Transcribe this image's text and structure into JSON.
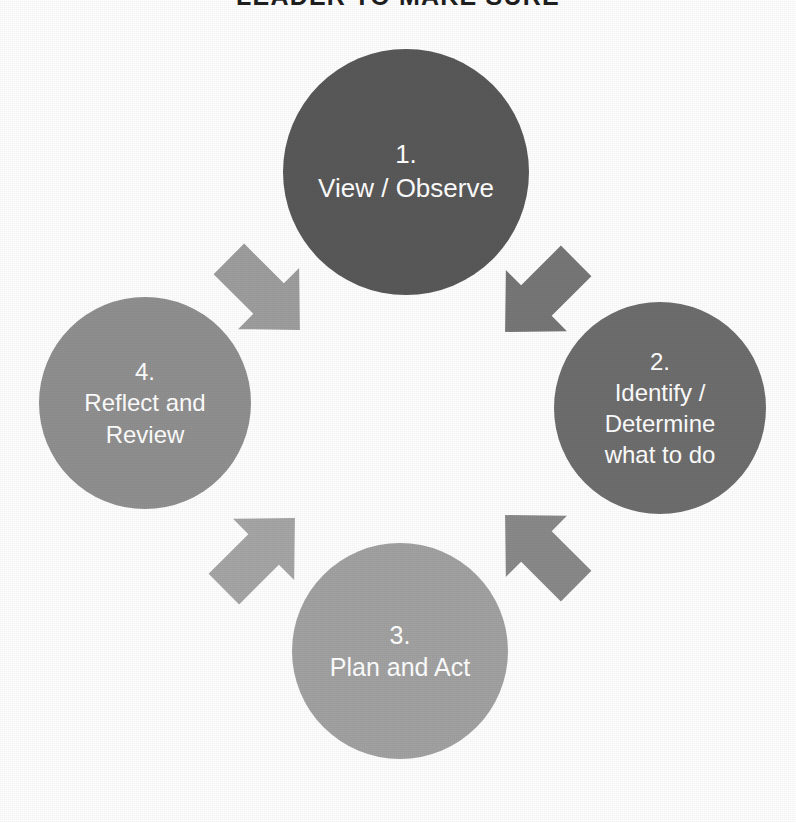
{
  "page": {
    "width": 796,
    "height": 822,
    "background": "#ffffff"
  },
  "title": {
    "text": "LEADER TO MAKE SURE",
    "color": "#1f1f1f",
    "clipped_at_top": true
  },
  "diagram": {
    "type": "cycle",
    "direction": "clockwise",
    "step_count": 4,
    "nodes": [
      {
        "id": "node-1",
        "number": "1.",
        "label": "1.\nView / Observe",
        "position": "top",
        "cx": 406,
        "cy": 172,
        "diameter": 246,
        "color": "#595959"
      },
      {
        "id": "node-2",
        "number": "2.",
        "label": "2.\nIdentify /\nDetermine\nwhat to do",
        "position": "right",
        "cx": 660,
        "cy": 408,
        "diameter": 212,
        "color": "#6e6e6e"
      },
      {
        "id": "node-3",
        "number": "3.",
        "label": "3.\nPlan and Act",
        "position": "bottom",
        "cx": 400,
        "cy": 651,
        "diameter": 216,
        "color": "#a2a2a2"
      },
      {
        "id": "node-4",
        "number": "4.",
        "label": "4.\nReflect and\nReview",
        "position": "left",
        "cx": 145,
        "cy": 403,
        "diameter": 212,
        "color": "#909090"
      }
    ],
    "arrows": [
      {
        "id": "arrow-1-to-2",
        "from": "node-1",
        "to": "node-2",
        "direction": "down-right",
        "color": "#777777",
        "x": 487,
        "y": 242,
        "size": 108,
        "rotation": 135
      },
      {
        "id": "arrow-2-to-3",
        "from": "node-2",
        "to": "node-3",
        "direction": "down-left",
        "color": "#8a8a8a",
        "x": 487,
        "y": 497,
        "size": 108,
        "rotation": 225
      },
      {
        "id": "arrow-3-to-4",
        "from": "node-3",
        "to": "node-4",
        "direction": "up-left",
        "color": "#a6a6a6",
        "x": 205,
        "y": 500,
        "size": 108,
        "rotation": 315
      },
      {
        "id": "arrow-4-to-1",
        "from": "node-4",
        "to": "node-1",
        "direction": "up-right",
        "color": "#9e9e9e",
        "x": 210,
        "y": 240,
        "size": 108,
        "rotation": 45
      }
    ]
  }
}
